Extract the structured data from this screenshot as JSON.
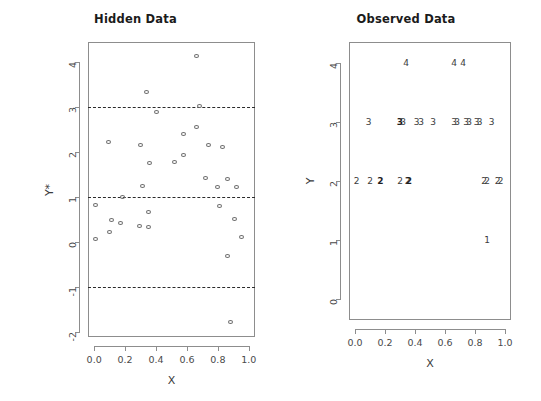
{
  "figure": {
    "width": 541,
    "height": 401,
    "background": "#ffffff",
    "axis_color": "#8d8d8d",
    "point_color": "#6b6b6b",
    "dashline_color": "#2b2b2b"
  },
  "chart_data": [
    {
      "type": "scatter",
      "title": "Hidden Data",
      "xlabel": "X",
      "ylabel": "Y*",
      "xlim": [
        -0.04,
        1.04
      ],
      "ylim": [
        -2.1,
        4.45
      ],
      "xticks": [
        0.0,
        0.2,
        0.4,
        0.6,
        0.8,
        1.0
      ],
      "xticklabels": [
        "0.0",
        "0.2",
        "0.4",
        "0.6",
        "0.8",
        "1.0"
      ],
      "yticks": [
        4,
        3,
        2,
        1,
        0,
        -1,
        -2
      ],
      "yticklabels": [
        "4",
        "3",
        "2",
        "1",
        "0",
        "-1",
        "-2"
      ],
      "grid": false,
      "legend": "none",
      "marker": "open-circle",
      "annotations": [
        {
          "kind": "hline",
          "y": 3,
          "style": "dashed",
          "label": "cut-point 3"
        },
        {
          "kind": "hline",
          "y": 1,
          "style": "dashed",
          "label": "cut-point 1"
        },
        {
          "kind": "hline",
          "y": -1,
          "style": "dashed",
          "label": "cut-point -1"
        }
      ],
      "points": [
        {
          "x": 0.66,
          "y": 4.13
        },
        {
          "x": 0.34,
          "y": 3.33
        },
        {
          "x": 0.4,
          "y": 2.9
        },
        {
          "x": 0.68,
          "y": 3.02
        },
        {
          "x": 0.09,
          "y": 2.23
        },
        {
          "x": 0.3,
          "y": 2.16
        },
        {
          "x": 0.58,
          "y": 2.4
        },
        {
          "x": 0.66,
          "y": 2.56
        },
        {
          "x": 0.74,
          "y": 2.16
        },
        {
          "x": 0.83,
          "y": 2.12
        },
        {
          "x": 0.52,
          "y": 1.79
        },
        {
          "x": 0.36,
          "y": 1.76
        },
        {
          "x": 0.58,
          "y": 1.95
        },
        {
          "x": 0.72,
          "y": 1.44
        },
        {
          "x": 0.86,
          "y": 1.41
        },
        {
          "x": 0.31,
          "y": 1.26
        },
        {
          "x": 0.8,
          "y": 1.24
        },
        {
          "x": 0.92,
          "y": 1.22
        },
        {
          "x": 0.18,
          "y": 1.0
        },
        {
          "x": 0.01,
          "y": 0.82
        },
        {
          "x": 0.81,
          "y": 0.8
        },
        {
          "x": 0.35,
          "y": 0.68
        },
        {
          "x": 0.11,
          "y": 0.5
        },
        {
          "x": 0.17,
          "y": 0.43
        },
        {
          "x": 0.91,
          "y": 0.51
        },
        {
          "x": 0.29,
          "y": 0.36
        },
        {
          "x": 0.35,
          "y": 0.35
        },
        {
          "x": 0.1,
          "y": 0.23
        },
        {
          "x": 0.95,
          "y": 0.11
        },
        {
          "x": 0.01,
          "y": 0.07
        },
        {
          "x": 0.86,
          "y": -0.3
        },
        {
          "x": 0.88,
          "y": -1.77
        }
      ]
    },
    {
      "type": "scatter",
      "title": "Observed Data",
      "xlabel": "X",
      "ylabel": "Y",
      "xlim": [
        -0.04,
        1.04
      ],
      "ylim": [
        -0.35,
        4.35
      ],
      "xticks": [
        0.0,
        0.2,
        0.4,
        0.6,
        0.8,
        1.0
      ],
      "xticklabels": [
        "0.0",
        "0.2",
        "0.4",
        "0.6",
        "0.8",
        "1.0"
      ],
      "yticks": [
        4,
        3,
        2,
        1,
        0
      ],
      "yticklabels": [
        "4",
        "3",
        "2",
        "1",
        "0"
      ],
      "grid": false,
      "legend": "none",
      "marker": "text-digit",
      "points": [
        {
          "x": 0.34,
          "y": 4,
          "label": "4"
        },
        {
          "x": 0.66,
          "y": 4,
          "label": "4"
        },
        {
          "x": 0.72,
          "y": 4,
          "label": "4"
        },
        {
          "x": 0.09,
          "y": 3,
          "label": "3"
        },
        {
          "x": 0.3,
          "y": 3,
          "label": "3",
          "bold": true
        },
        {
          "x": 0.32,
          "y": 3,
          "label": "3"
        },
        {
          "x": 0.41,
          "y": 3,
          "label": "3"
        },
        {
          "x": 0.44,
          "y": 3,
          "label": "3"
        },
        {
          "x": 0.52,
          "y": 3,
          "label": "3"
        },
        {
          "x": 0.66,
          "y": 3,
          "label": "3"
        },
        {
          "x": 0.68,
          "y": 3,
          "label": "3"
        },
        {
          "x": 0.74,
          "y": 3,
          "label": "3"
        },
        {
          "x": 0.76,
          "y": 3,
          "label": "3"
        },
        {
          "x": 0.81,
          "y": 3,
          "label": "3"
        },
        {
          "x": 0.83,
          "y": 3,
          "label": "3"
        },
        {
          "x": 0.91,
          "y": 3,
          "label": "3"
        },
        {
          "x": 0.01,
          "y": 2,
          "label": "2"
        },
        {
          "x": 0.1,
          "y": 2,
          "label": "2"
        },
        {
          "x": 0.17,
          "y": 2,
          "label": "2",
          "bold": true
        },
        {
          "x": 0.3,
          "y": 2,
          "label": "2"
        },
        {
          "x": 0.35,
          "y": 2,
          "label": "2"
        },
        {
          "x": 0.36,
          "y": 2,
          "label": "2",
          "bold": true
        },
        {
          "x": 0.86,
          "y": 2,
          "label": "2"
        },
        {
          "x": 0.88,
          "y": 2,
          "label": "2"
        },
        {
          "x": 0.95,
          "y": 2,
          "label": "2"
        },
        {
          "x": 0.97,
          "y": 2,
          "label": "2"
        },
        {
          "x": 0.88,
          "y": 1,
          "label": "1"
        }
      ]
    }
  ]
}
